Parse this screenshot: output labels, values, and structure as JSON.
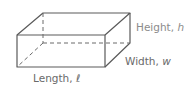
{
  "figure": {
    "type": "rectangular-prism",
    "labels": {
      "height": {
        "word": "Height, ",
        "var": "h"
      },
      "width": {
        "word": "Width, ",
        "var": "w"
      },
      "length": {
        "word": "Length, ",
        "var": "ℓ"
      }
    },
    "colors": {
      "edge": "#5a5a5a",
      "height_label": "#8c8c8c",
      "other_labels": "#6a6a6a"
    }
  }
}
